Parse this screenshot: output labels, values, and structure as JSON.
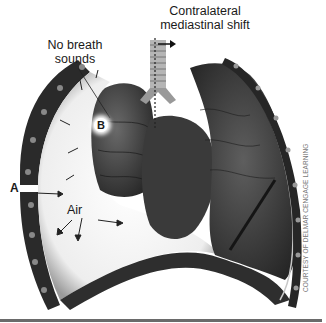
{
  "diagram": {
    "labels": {
      "title_line1": "Contralateral",
      "title_line2": "mediastinal shift",
      "no_breath_line1": "No breath",
      "no_breath_line2": "sounds",
      "air": "Air",
      "marker_a": "A",
      "marker_b": "B"
    },
    "credit": "COURTESY OF DELMAR CENGAGE LEARNING",
    "icons": {
      "shift_arrow": "right-arrow-icon",
      "air_flow_arrows": "arrow-icon"
    },
    "colors": {
      "background": "#ffffff",
      "tissue_dark": "#2b2b2b",
      "tissue_mid": "#555555",
      "pleural_space": "#f2f2f2",
      "rule": "#6a6a6a"
    }
  }
}
